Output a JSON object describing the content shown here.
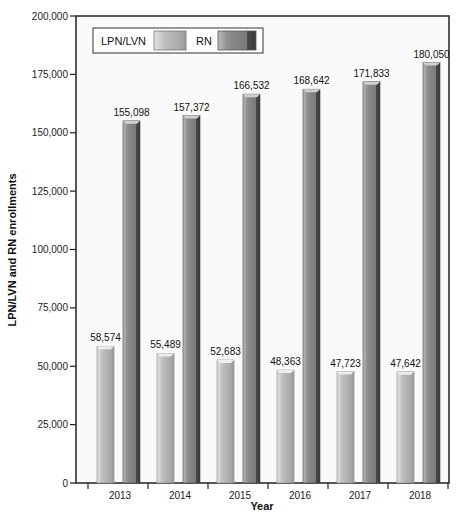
{
  "chart_data": {
    "type": "bar",
    "title": "",
    "xlabel": "Year",
    "ylabel": "LPN/LVN and RN enrollments",
    "categories": [
      "2013",
      "2014",
      "2015",
      "2016",
      "2017",
      "2018"
    ],
    "series": [
      {
        "name": "LPN/LVN",
        "color": "#b3b3b3",
        "values": [
          58574,
          55489,
          52683,
          48363,
          47723,
          47642
        ],
        "labels": [
          "58,574",
          "55,489",
          "52,683",
          "48,363",
          "47,723",
          "47,642"
        ]
      },
      {
        "name": "RN",
        "color": "#7a7a7a",
        "values": [
          155098,
          157372,
          166532,
          168642,
          171833,
          180050
        ],
        "labels": [
          "155,098",
          "157,372",
          "166,532",
          "168,642",
          "171,833",
          "180,050"
        ]
      }
    ],
    "ylim": [
      0,
      200000
    ],
    "yticks": [
      0,
      25000,
      50000,
      75000,
      100000,
      125000,
      150000,
      175000,
      200000
    ],
    "ytick_labels": [
      "0",
      "25,000",
      "50,000",
      "75,000",
      "100,000",
      "125,000",
      "150,000",
      "175,000",
      "200,000"
    ],
    "grid": false,
    "legend": "top-left"
  }
}
